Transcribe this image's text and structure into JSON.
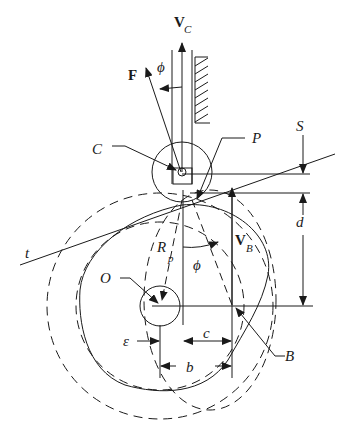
{
  "diagram": {
    "labels": {
      "velocity_C": "V",
      "velocity_C_sub": "C",
      "force": "F",
      "phi_top": "ϕ",
      "point_C": "C",
      "point_P": "P",
      "S": "S",
      "d": "d",
      "tangent": "t",
      "R": "R",
      "R_sub": "p",
      "velocity_B": "V",
      "velocity_B_sub": "B",
      "phi_mid": "ϕ",
      "point_O": "O",
      "epsilon": "ε",
      "c": "c",
      "point_B": "B",
      "b": "b"
    },
    "colors": {
      "stroke": "#1a1a1a",
      "background": "#ffffff"
    }
  }
}
